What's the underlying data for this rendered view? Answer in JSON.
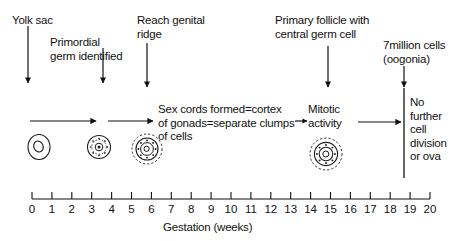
{
  "figure": {
    "axis": {
      "label": "Gestation  (weeks)",
      "min": 0,
      "max": 20,
      "ticks": [
        "0",
        "1",
        "2",
        "3",
        "4",
        "5",
        "6",
        "7",
        "8",
        "9",
        "10",
        "11",
        "12",
        "13",
        "14",
        "15",
        "16",
        "17",
        "18",
        "19",
        "20"
      ]
    },
    "callouts": [
      {
        "id": "yolk-sac",
        "text": "Yolk sac",
        "week": 0
      },
      {
        "id": "primordial-germ-identified",
        "text": "Primordial\ngerm identified",
        "week": 3.6
      },
      {
        "id": "reach-genital-ridge",
        "text": "Reach genital\nridge",
        "week": 5.8
      },
      {
        "id": "primary-follicle",
        "text": "Primary follicle with\ncentral germ cell",
        "week": 14.9
      },
      {
        "id": "seven-million-cells",
        "text": "7million cells\n(oogonia)",
        "week": 18.7
      }
    ],
    "stages": [
      {
        "id": "sex-cords",
        "text": "Sex cords formed=cortex\nof gonads=separate clumps\nof cells"
      },
      {
        "id": "mitotic-activity",
        "text": "Mitotic\nactivity"
      },
      {
        "id": "no-further-division",
        "text": "No\nfurther\ncell\ndivision\nor ova"
      }
    ],
    "cells": [
      {
        "id": "cell-primordial",
        "kind": "plain-oval",
        "week": 0.3
      },
      {
        "id": "cell-germ-with-granulosa",
        "kind": "dotted-ring-small",
        "week": 3.3
      },
      {
        "id": "cell-oogonium",
        "kind": "dotted-ring-medium",
        "week": 5.7
      },
      {
        "id": "cell-primary-follicle",
        "kind": "dotted-ring-large",
        "week": 14.7
      }
    ],
    "colors": {
      "ink": "#111111",
      "background": "#ffffff"
    }
  }
}
